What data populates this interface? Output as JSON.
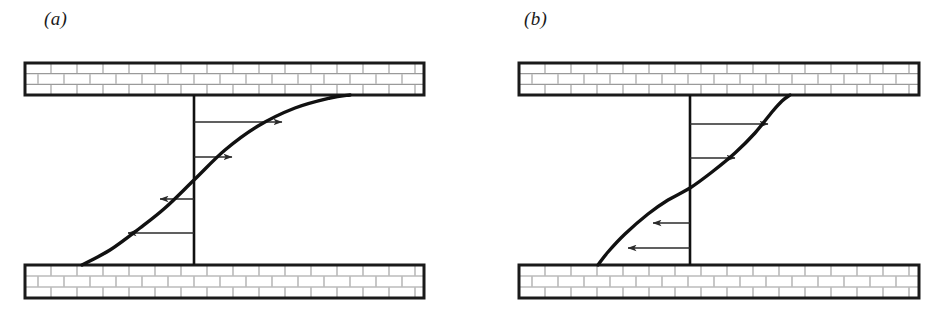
{
  "figure": {
    "width": 949,
    "height": 325,
    "background": "#ffffff",
    "type": "scientific-diagram"
  },
  "colors": {
    "ink": "#1a1a1a",
    "wall_border": "#1a1a1a",
    "brick_fill": "#ffffff",
    "brick_mortar": "#9a9a9a",
    "curve": "#111111",
    "arrow": "#2b2b2b",
    "axis": "#111111"
  },
  "panels": [
    {
      "id": "panel-a",
      "label": "(a)",
      "label_pos": {
        "x": 44,
        "y": 8
      },
      "bounds": {
        "x": 25,
        "y": 63,
        "width": 399,
        "height": 235
      },
      "walls": {
        "top": {
          "x": 25,
          "y": 63,
          "width": 399,
          "height": 32,
          "rows": 3,
          "brick_width": 26
        },
        "bottom": {
          "x": 25,
          "y": 265,
          "width": 399,
          "height": 33,
          "rows": 3,
          "brick_width": 26
        }
      },
      "axis_line": {
        "x": 194,
        "y_top": 95,
        "y_bottom": 265
      },
      "profile": {
        "name": "broad-s-curve",
        "points": [
          [
            82,
            265
          ],
          [
            110,
            250
          ],
          [
            140,
            228
          ],
          [
            165,
            208
          ],
          [
            194,
            180
          ],
          [
            225,
            150
          ],
          [
            258,
            126
          ],
          [
            295,
            108
          ],
          [
            330,
            98
          ],
          [
            350,
            95
          ]
        ]
      },
      "arrows": [
        {
          "direction": "right",
          "y": 122,
          "x_start": 194,
          "x_end": 282,
          "length": 88
        },
        {
          "direction": "right",
          "y": 157,
          "x_start": 194,
          "x_end": 232,
          "length": 38
        },
        {
          "direction": "left",
          "y": 199,
          "x_start": 194,
          "x_end": 160,
          "length": 34
        },
        {
          "direction": "left",
          "y": 233,
          "x_start": 194,
          "x_end": 128,
          "length": 66
        }
      ]
    },
    {
      "id": "panel-b",
      "label": "(b)",
      "label_pos": {
        "x": 524,
        "y": 8
      },
      "bounds": {
        "x": 519,
        "y": 63,
        "width": 400,
        "height": 235
      },
      "walls": {
        "top": {
          "x": 519,
          "y": 63,
          "width": 400,
          "height": 32,
          "rows": 3,
          "brick_width": 26
        },
        "bottom": {
          "x": 519,
          "y": 265,
          "width": 400,
          "height": 33,
          "rows": 3,
          "brick_width": 26
        }
      },
      "axis_line": {
        "x": 690,
        "y_top": 95,
        "y_bottom": 265
      },
      "profile": {
        "name": "steep-s-curve",
        "points": [
          [
            598,
            265
          ],
          [
            608,
            252
          ],
          [
            625,
            234
          ],
          [
            648,
            214
          ],
          [
            668,
            200
          ],
          [
            690,
            188
          ],
          [
            712,
            172
          ],
          [
            735,
            153
          ],
          [
            755,
            133
          ],
          [
            772,
            112
          ],
          [
            782,
            101
          ],
          [
            790,
            95
          ]
        ]
      },
      "arrows": [
        {
          "direction": "right",
          "y": 124,
          "x_start": 690,
          "x_end": 768,
          "length": 78
        },
        {
          "direction": "right",
          "y": 158,
          "x_start": 690,
          "x_end": 735,
          "length": 45
        },
        {
          "direction": "left",
          "y": 223,
          "x_start": 690,
          "x_end": 653,
          "length": 37
        },
        {
          "direction": "left",
          "y": 248,
          "x_start": 690,
          "x_end": 628,
          "length": 62
        }
      ]
    }
  ]
}
